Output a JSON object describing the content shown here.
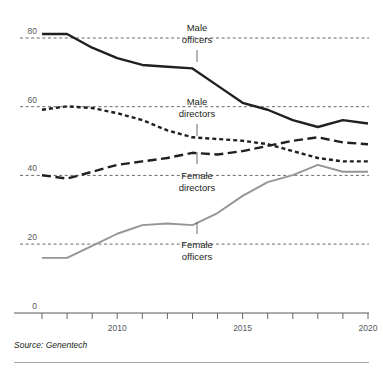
{
  "chart_data": {
    "type": "line",
    "title": "",
    "subtitle": "",
    "xlabel": "",
    "ylabel": "",
    "xlim": [
      2007,
      2020
    ],
    "ylim": [
      0,
      88
    ],
    "grid": "horizontal-dashed",
    "legend": "inline-annotations",
    "x": [
      2007,
      2008,
      2009,
      2010,
      2011,
      2012,
      2013,
      2014,
      2015,
      2016,
      2017,
      2018,
      2019,
      2020
    ],
    "series": [
      {
        "name": "Male officers",
        "style": "solid",
        "color": "#231f20",
        "values": [
          81,
          81,
          77,
          74,
          72,
          71.5,
          71,
          66,
          61,
          59,
          56,
          54,
          56,
          55
        ]
      },
      {
        "name": "Male directors",
        "style": "dotted",
        "color": "#231f20",
        "values": [
          59,
          60,
          59.5,
          58,
          56,
          53,
          51,
          50.5,
          50,
          49,
          47,
          45,
          44,
          44
        ]
      },
      {
        "name": "Female directors",
        "style": "dashed",
        "color": "#231f20",
        "values": [
          40,
          39,
          41,
          43,
          44,
          45,
          46.5,
          46,
          47,
          48.5,
          50,
          51,
          49.5,
          49
        ]
      },
      {
        "name": "Female officers",
        "style": "solid",
        "color": "#939598",
        "values": [
          16,
          16,
          19.5,
          23,
          25.5,
          26,
          25.5,
          29,
          34,
          38,
          40,
          43,
          41,
          41
        ]
      }
    ],
    "y_ticks": [
      0,
      20,
      40,
      60,
      80
    ],
    "y_tick_labels": [
      "0",
      "20",
      "40",
      "60",
      "80"
    ],
    "x_ticks": [
      2007,
      2008,
      2009,
      2010,
      2011,
      2012,
      2013,
      2014,
      2015,
      2016,
      2017,
      2018,
      2019,
      2020
    ],
    "x_tick_labels": [
      "2010",
      "2015",
      "2020"
    ],
    "x_labeled_ticks": [
      2010,
      2015,
      2020
    ],
    "annotations": [
      {
        "name": "male-officers",
        "text_line1": "Male",
        "text_line2": "officers",
        "x": 2012.6,
        "y_top": 24,
        "leader_y1": 50,
        "leader_y2": 62
      },
      {
        "name": "male-directors",
        "text_line1": "Male",
        "text_line2": "directors",
        "x": 2012.6,
        "y_top": 98,
        "leader_y1": 124,
        "leader_y2": 136
      },
      {
        "name": "female-directors",
        "text_line1": "Female",
        "text_line2": "directors",
        "x": 2012.6,
        "y_top": 156,
        "leader_y1": 182,
        "leader_y2": 194
      },
      {
        "name": "female-officers",
        "text_line1": "Female",
        "text_line2": "officers",
        "x": 2012.6,
        "y_top": 228,
        "leader_y1": 254,
        "leader_y2": 266
      }
    ]
  },
  "axis": {
    "y_labels": [
      "80",
      "60",
      "40",
      "20",
      "0"
    ],
    "x_labels": [
      "2010",
      "2015",
      "2020"
    ]
  },
  "footer": {
    "source": "Source: Genentech"
  },
  "colors": {
    "ink": "#231f20",
    "grid": "#58595b",
    "gray_series": "#939598",
    "rule": "#a7a9ac"
  }
}
